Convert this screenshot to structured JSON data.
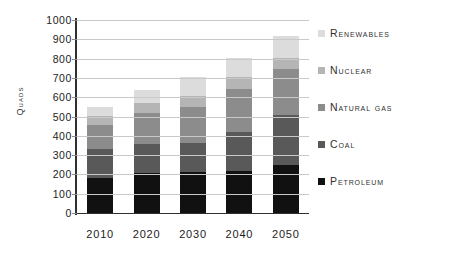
{
  "chart_data": {
    "type": "bar",
    "stacked": true,
    "title": "",
    "xlabel": "",
    "ylabel": "Quads",
    "ylim": [
      0,
      1000
    ],
    "ytick_step": 100,
    "yticks": [
      1000,
      900,
      800,
      700,
      600,
      500,
      400,
      300,
      200,
      100,
      0
    ],
    "grid": true,
    "legend_position": "right",
    "categories": [
      "2010",
      "2020",
      "2030",
      "2040",
      "2050"
    ],
    "series": [
      {
        "name": "Petroleum",
        "color": "#111111",
        "values": [
          180,
          205,
          210,
          220,
          250
        ]
      },
      {
        "name": "Coal",
        "color": "#595959",
        "values": [
          150,
          155,
          155,
          200,
          260
        ]
      },
      {
        "name": "Natural gas",
        "color": "#8c8c8c",
        "values": [
          125,
          160,
          185,
          225,
          235
        ]
      },
      {
        "name": "Nuclear",
        "color": "#b5b5b5",
        "values": [
          50,
          50,
          55,
          60,
          60
        ]
      },
      {
        "name": "Renewables",
        "color": "#dcdcdc",
        "values": [
          45,
          70,
          100,
          100,
          110
        ]
      }
    ],
    "totals": [
      550,
      640,
      705,
      805,
      915
    ],
    "legend_order": [
      "Renewables",
      "Nuclear",
      "Natural gas",
      "Coal",
      "Petroleum"
    ]
  },
  "axis": {
    "y_title": "Quads"
  },
  "colors": {
    "axis": "#303030",
    "grid": "#c9c9c9",
    "text": "#1c1c1c",
    "background": "#ffffff"
  }
}
